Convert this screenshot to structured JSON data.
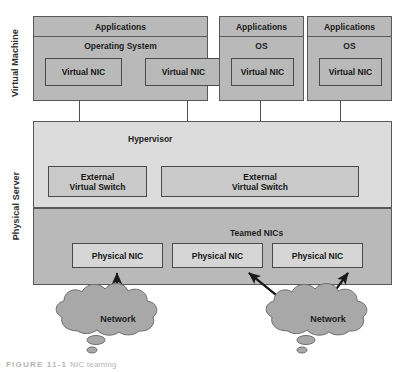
{
  "figure": {
    "caption_number": "FIGURE 11-1",
    "caption_text": "NIC teaming"
  },
  "side_labels": {
    "virtual_machine": "Virtual Machine",
    "physical_server": "Physical Server"
  },
  "virtual_machines": [
    {
      "applications": "Applications",
      "os": "Operating System",
      "nics": [
        "Virtual NIC",
        "Virtual NIC"
      ]
    },
    {
      "applications": "Applications",
      "os": "OS",
      "nics": [
        "Virtual NIC"
      ]
    },
    {
      "applications": "Applications",
      "os": "OS",
      "nics": [
        "Virtual NIC"
      ]
    }
  ],
  "hypervisor": {
    "label": "Hypervisor",
    "switches": [
      {
        "line1": "External",
        "line2": "Virtual Switch"
      },
      {
        "line1": "External",
        "line2": "Virtual Switch"
      }
    ]
  },
  "nic_layer": {
    "teamed_label": "Teamed NICs",
    "physical_nics": [
      "Physical NIC",
      "Physical NIC",
      "Physical NIC"
    ]
  },
  "networks": [
    {
      "label": "Network"
    },
    {
      "label": "Network"
    }
  ],
  "colors": {
    "vm_fill": "#b9b9b9",
    "hypervisor_fill": "#dcdcdc",
    "nic_band_fill": "#b9b9b9",
    "cloud_fill": "#a8a8a8",
    "stroke": "#595959",
    "arrow": "#1a1a1a"
  }
}
